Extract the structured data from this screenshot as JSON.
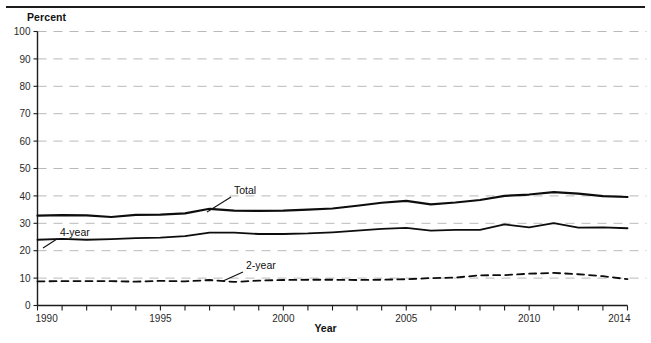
{
  "figure": {
    "y_axis_title": "Percent",
    "x_axis_title": "Year"
  },
  "annotations": {
    "total_label": "Total",
    "four_year_label": "4-year",
    "two_year_label": "2-year"
  },
  "chart_data": {
    "type": "line",
    "title": "",
    "xlabel": "Year",
    "ylabel": "Percent",
    "xlim": [
      1990,
      2014
    ],
    "ylim": [
      0,
      100
    ],
    "grid": true,
    "legend_position": "inline-annotations",
    "x_tick_labels": [
      "1990",
      "1995",
      "2000",
      "2005",
      "2010",
      "2014"
    ],
    "x_tick_label_values": [
      1990,
      1995,
      2000,
      2005,
      2010,
      2014
    ],
    "y_tick_labels": [
      "0",
      "10",
      "20",
      "30",
      "40",
      "50",
      "60",
      "70",
      "80",
      "90",
      "100"
    ],
    "y_tick_values": [
      0,
      10,
      20,
      30,
      40,
      50,
      60,
      70,
      80,
      90,
      100
    ],
    "x": [
      1990,
      1991,
      1992,
      1993,
      1994,
      1995,
      1996,
      1997,
      1998,
      1999,
      2000,
      2001,
      2002,
      2003,
      2004,
      2005,
      2006,
      2007,
      2008,
      2009,
      2010,
      2011,
      2012,
      2013,
      2014
    ],
    "series": [
      {
        "name": "Total",
        "style": "solid",
        "color": "#0d0d0d",
        "values": [
          32.8,
          33.0,
          32.9,
          32.3,
          33.1,
          33.2,
          33.6,
          35.3,
          34.6,
          34.5,
          34.6,
          35.0,
          35.4,
          36.4,
          37.5,
          38.2,
          36.9,
          37.6,
          38.5,
          40.0,
          40.5,
          41.4,
          40.8,
          39.9,
          39.6
        ],
        "dash": null
      },
      {
        "name": "4-year",
        "style": "solid",
        "color": "#0d0d0d",
        "values": [
          24.0,
          24.3,
          24.0,
          24.2,
          24.6,
          24.8,
          25.3,
          26.6,
          26.6,
          26.1,
          26.1,
          26.3,
          26.7,
          27.3,
          28.0,
          28.3,
          27.3,
          27.6,
          27.6,
          29.6,
          28.5,
          30.1,
          28.4,
          28.5,
          28.2
        ],
        "dash": null
      },
      {
        "name": "2-year",
        "style": "dashed",
        "color": "#0d0d0d",
        "values": [
          8.8,
          8.9,
          8.9,
          8.9,
          8.7,
          9.0,
          8.8,
          9.3,
          8.6,
          9.1,
          9.3,
          9.4,
          9.4,
          9.3,
          9.4,
          9.6,
          10.0,
          10.2,
          11.0,
          11.1,
          11.6,
          11.9,
          11.4,
          10.7,
          9.6
        ],
        "dash": "7 5"
      }
    ]
  }
}
